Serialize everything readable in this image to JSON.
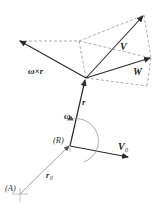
{
  "diagram": {
    "title": "",
    "labels": {
      "omega_cross_r": "ω×r",
      "V": "V",
      "W": "W",
      "r": "r",
      "omega": "ω",
      "R": "(R)",
      "V0_main": "V",
      "V0_sub": "0",
      "A": "(A)",
      "r0_main": "r",
      "r0_sub": "0"
    },
    "colors": {
      "vector": "#2a2a2a",
      "dashed": "#9a9a9a",
      "thin": "#8a8a8a"
    }
  }
}
